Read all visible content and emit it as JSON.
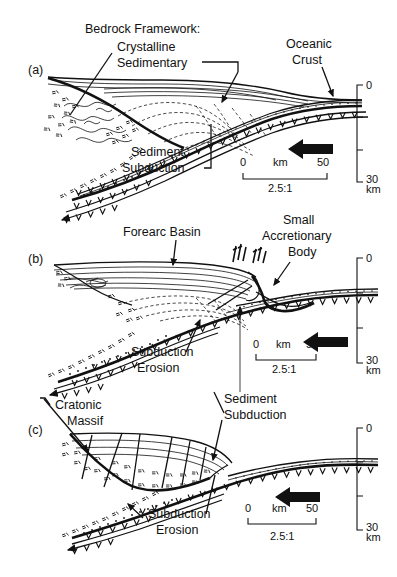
{
  "figure": {
    "background_color": "#ffffff",
    "ink_color": "#111111",
    "panel_count": 3
  },
  "panels": [
    {
      "id": "(a)",
      "name": "accretionary-margin",
      "labels": {
        "bedrock_framework": "Bedrock Framework:",
        "crystalline": "Crystalline",
        "sedimentary": "Sedimentary",
        "oceanic_crust_line1": "Oceanic",
        "oceanic_crust_line2": "Crust",
        "sediment_subduction_line1": "Sediment",
        "sediment_subduction_line2": "Subduction"
      },
      "scale_bar": {
        "left": "0",
        "unit": "km",
        "right": "50",
        "exaggeration": "2.5:1"
      },
      "depth_axis": {
        "top": "0",
        "bottom": "30",
        "unit": "km",
        "ticks": 4
      }
    },
    {
      "id": "(b)",
      "name": "forearc-basin-margin",
      "labels": {
        "forearc_basin": "Forearc Basin",
        "small_line1": "Small",
        "small_line2": "Accretionary",
        "small_line3": "Body",
        "subduction_erosion_line1": "Subduction",
        "subduction_erosion_line2": "Erosion"
      },
      "scale_bar": {
        "left": "0",
        "unit": "km",
        "right": "50",
        "exaggeration": "2.5:1"
      },
      "depth_axis": {
        "top": "0",
        "bottom": "30",
        "unit": "km",
        "ticks": 4
      }
    },
    {
      "id": "(c)",
      "name": "cratonic-massif-margin",
      "labels": {
        "cratonic_line1": "Cratonic",
        "cratonic_line2": "Massif",
        "sediment_subduction_line1": "Sediment",
        "sediment_subduction_line2": "Subduction",
        "subduction_erosion_line1": "Subduction",
        "subduction_erosion_line2": "Erosion"
      },
      "scale_bar": {
        "left": "0",
        "unit": "km",
        "right": "50",
        "exaggeration": "2.5:1"
      },
      "depth_axis": {
        "top": "0",
        "bottom": "30",
        "unit": "km",
        "ticks": 4
      }
    }
  ],
  "legend_symbols": {
    "v_pattern": "mantle-wedge-v-hatching",
    "stipple": "subducted-sediment-stipple",
    "equals_hatch": "crystalline-basement-hatch",
    "dashed_lines": "accreted-thrust-packets",
    "arrow": "plate-convergence-direction"
  }
}
